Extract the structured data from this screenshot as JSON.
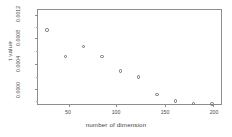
{
  "chart_data": {
    "type": "scatter",
    "title": "",
    "xlabel": "number of dimension",
    "ylabel": "t value",
    "xlim": [
      10,
      210
    ],
    "ylim": [
      0.0,
      0.00128
    ],
    "grid": false,
    "legend": null,
    "xticks": [
      50,
      100,
      150,
      200
    ],
    "xticklabels": [
      "50",
      "100",
      "150",
      "200"
    ],
    "yticks": [
      0.0,
      0.0004,
      0.0008,
      0.0012
    ],
    "yticklabels": [
      "0.0000",
      "0.0004",
      "0.0008",
      "0.0012"
    ],
    "marker": "open-circle",
    "marker_color": "#6f6f6f",
    "x": [
      20,
      40,
      60,
      80,
      100,
      120,
      140,
      160,
      180,
      200
    ],
    "y": [
      0.00101,
      0.00065,
      0.00078,
      0.00065,
      0.00045,
      0.00037,
      0.00013,
      4e-05,
      1e-05,
      0.0
    ],
    "points": [
      {
        "x": 20,
        "y": 0.00101
      },
      {
        "x": 40,
        "y": 0.00065
      },
      {
        "x": 60,
        "y": 0.00078
      },
      {
        "x": 80,
        "y": 0.00065
      },
      {
        "x": 100,
        "y": 0.00045
      },
      {
        "x": 120,
        "y": 0.00037
      },
      {
        "x": 140,
        "y": 0.00013
      },
      {
        "x": 160,
        "y": 4e-05
      },
      {
        "x": 180,
        "y": 1e-05
      },
      {
        "x": 200,
        "y": 0.0
      }
    ]
  },
  "axis": {
    "x_title": "number of dimension",
    "y_title": "t value",
    "x_tick_labels": [
      "50",
      "100",
      "150",
      "200"
    ],
    "y_tick_labels": [
      "0.0000",
      "0.0004",
      "0.0008",
      "0.0012"
    ]
  },
  "colors": {
    "background": "#ffffff",
    "frame": "#8d8d8d",
    "marker": "#6f6f6f",
    "text": "#4a4a4a"
  }
}
